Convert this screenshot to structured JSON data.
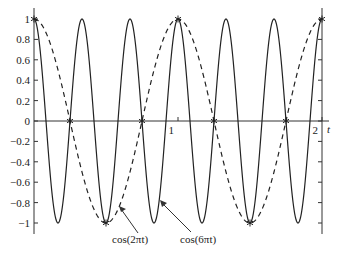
{
  "chart_data": {
    "type": "line",
    "title": "",
    "xlabel": "t",
    "ylabel": "",
    "xlim": [
      0,
      2
    ],
    "ylim": [
      -1,
      1
    ],
    "grid": false,
    "legend": "none (annotated with arrows)",
    "x_ticks": [
      "1",
      "2"
    ],
    "y_ticks": [
      "1",
      "0.8",
      "0.6",
      "0.4",
      "0.2",
      "0",
      "−0.2",
      "−0.4",
      "−0.6",
      "−0.8",
      "−1"
    ],
    "series": [
      {
        "name": "cos(2πt)",
        "style": "dashed",
        "formula": "cos(2*pi*t)",
        "frequency": 1
      },
      {
        "name": "cos(6πt)",
        "style": "solid",
        "formula": "cos(6*pi*t)",
        "frequency": 3
      }
    ],
    "sample_points": {
      "marker": "*",
      "t": [
        0,
        0.25,
        0.5,
        0.75,
        1,
        1.25,
        1.5,
        1.75,
        2
      ],
      "values": [
        1,
        0,
        -1,
        0,
        1,
        0,
        -1,
        0,
        1
      ]
    },
    "annotations": [
      {
        "text": "cos(2πt)",
        "points_to": "dashed curve"
      },
      {
        "text": "cos(6πt)",
        "points_to": "solid curve"
      }
    ]
  },
  "labels": {
    "xaxis_label": "t",
    "tick_x_1": "1",
    "tick_x_2": "2",
    "ann_cos2": "cos(2πt)",
    "ann_cos6": "cos(6πt)"
  }
}
